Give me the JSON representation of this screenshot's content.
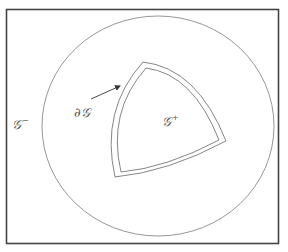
{
  "diagram": {
    "colors": {
      "frame": "#444444",
      "circle": "#888888",
      "boundary": "#777777",
      "arrow": "#333333",
      "text": "#555555"
    },
    "frame": {
      "x": 6,
      "y": 9,
      "width": 273,
      "height": 235
    },
    "outer_region": {
      "shape": "ellipse",
      "cx": 158,
      "cy": 126,
      "rx": 116,
      "ry": 110
    },
    "inner_region": {
      "shape": "curved-triangle",
      "corners": [
        [
          145,
          64
        ],
        [
          224,
          142
        ],
        [
          118,
          176
        ]
      ]
    },
    "labels": {
      "exterior": {
        "base": "𝒢",
        "sup": "−",
        "x": 12,
        "y": 117
      },
      "boundary": {
        "base": "∂𝒢",
        "x": 74,
        "y": 106
      },
      "interior": {
        "base": "𝒢",
        "sup": "+",
        "x": 162,
        "y": 114
      }
    },
    "arrow": {
      "from": [
        91,
        99
      ],
      "to": [
        120,
        86
      ]
    }
  }
}
